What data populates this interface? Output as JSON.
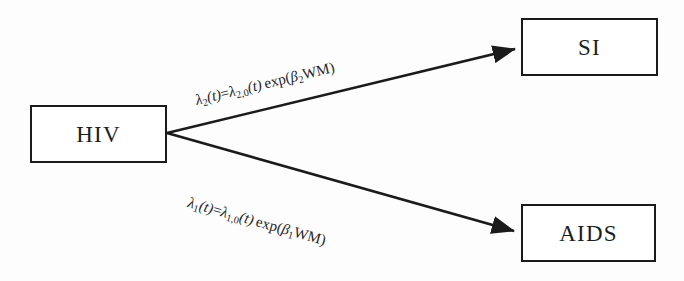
{
  "diagram": {
    "type": "flow-diagram",
    "title": "",
    "background_color": "#fdfdfd",
    "line_color": "#1b1b1b",
    "nodes": [
      {
        "id": "hiv",
        "label": "HIV",
        "x": 30,
        "y": 105,
        "width": 137,
        "height": 58
      },
      {
        "id": "si",
        "label": "SI",
        "x": 521,
        "y": 18,
        "width": 137,
        "height": 58
      },
      {
        "id": "aids",
        "label": "AIDS",
        "x": 521,
        "y": 204,
        "width": 135,
        "height": 58
      }
    ],
    "edges": [
      {
        "id": "hiv-to-si",
        "from": "hiv",
        "to": "si",
        "label_plain": "λ₂(t)=λ₂,₀(t) exp(β₂WM)",
        "label_parts": {
          "lambda": "λ",
          "lambda_sub": "2",
          "of_t": "(t)",
          "equals": "=",
          "lambda2": "λ",
          "lambda2_sub": "2,0",
          "of_t2": "(t)",
          "exp": "exp(",
          "beta": "β",
          "beta_sub": "2",
          "covariate": "WM",
          "close": ")"
        },
        "rotation_deg": -13.5,
        "start": {
          "x": 167,
          "y": 133
        },
        "end": {
          "x": 519,
          "y": 48
        }
      },
      {
        "id": "hiv-to-aids",
        "from": "hiv",
        "to": "aids",
        "label_plain": "λ₁(t)=λ₁,₀(t) exp(β₁WM)",
        "label_parts": {
          "lambda": "λ",
          "lambda_sub": "1",
          "of_t": "(t)",
          "equals": "=",
          "lambda2": "λ",
          "lambda2_sub": "1,0",
          "of_t2": "(t)",
          "exp": "exp(",
          "beta": "β",
          "beta_sub": "1",
          "covariate": "WM",
          "close": ")"
        },
        "rotation_deg": 15.6,
        "start": {
          "x": 167,
          "y": 133
        },
        "end": {
          "x": 519,
          "y": 232
        }
      }
    ]
  }
}
